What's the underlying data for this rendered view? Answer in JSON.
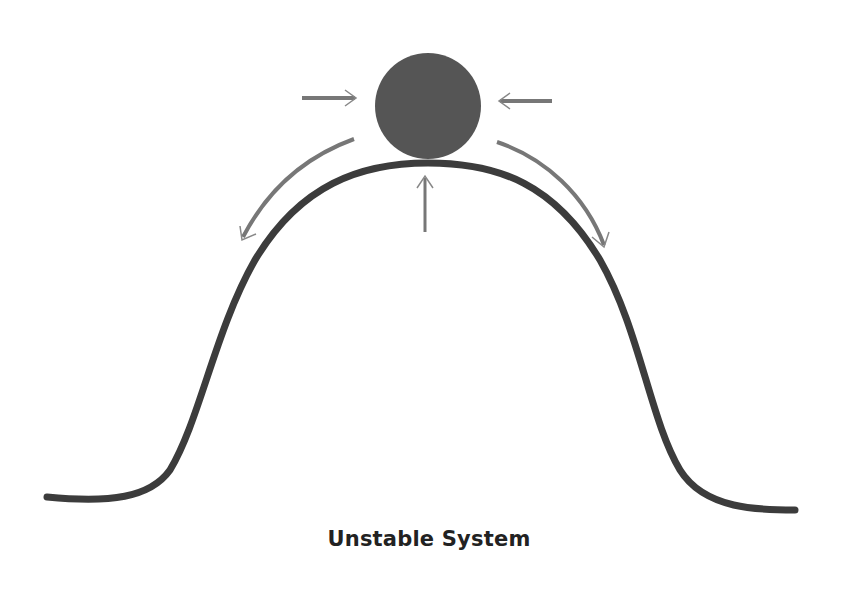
{
  "diagram": {
    "title": "Unstable System",
    "elements": {
      "ball": {
        "description": "ball resting on top of hill",
        "color": "#555555"
      },
      "hill": {
        "description": "bell-shaped hill curve",
        "color": "#3c3c3c"
      },
      "arrows": [
        {
          "name": "left-push-arrow",
          "direction": "right",
          "color": "#777777"
        },
        {
          "name": "right-push-arrow",
          "direction": "left",
          "color": "#777777"
        },
        {
          "name": "upward-support-arrow",
          "direction": "up",
          "color": "#777777"
        },
        {
          "name": "left-roll-off-arrow",
          "direction": "down-left",
          "color": "#777777"
        },
        {
          "name": "right-roll-off-arrow",
          "direction": "down-right",
          "color": "#777777"
        }
      ]
    },
    "colors": {
      "background": "#ffffff",
      "ball": "#555555",
      "curve": "#3c3c3c",
      "arrow": "#777777",
      "text": "#222222"
    }
  }
}
